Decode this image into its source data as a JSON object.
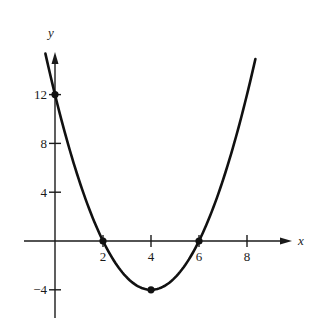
{
  "chart_data": {
    "type": "line",
    "title": "",
    "function": "y = x^2 - 8x + 12",
    "xlabel": "x",
    "ylabel": "y",
    "xlim": [
      -0.45,
      8.35
    ],
    "ylim": [
      -5,
      15.5
    ],
    "grid": false,
    "legend": null,
    "x_ticks": [
      2,
      4,
      6,
      8
    ],
    "x_tick_labels": [
      "2",
      "4",
      "6",
      "8"
    ],
    "y_ticks": [
      12,
      8,
      4,
      -4
    ],
    "y_tick_labels": [
      "12",
      "8",
      "4",
      "−4"
    ],
    "series": [
      {
        "name": "parabola",
        "color": "#111111",
        "coefficients": {
          "a": 1,
          "b": -8,
          "c": 12
        },
        "x_range": [
          -0.4,
          8.35
        ]
      }
    ],
    "marked_points": [
      {
        "x": 0,
        "y": 12,
        "label": "y-intercept"
      },
      {
        "x": 2,
        "y": 0,
        "label": "x-intercept"
      },
      {
        "x": 6,
        "y": 0,
        "label": "x-intercept"
      },
      {
        "x": 4,
        "y": -4,
        "label": "vertex"
      }
    ]
  },
  "layout": {
    "origin_px": [
      55,
      241
    ],
    "px_per_x": 24,
    "px_per_y": 12.2,
    "x_axis_px": [
      24,
      292
    ],
    "y_axis_px": [
      52,
      318
    ],
    "axis_color": "#1a1a1a"
  }
}
